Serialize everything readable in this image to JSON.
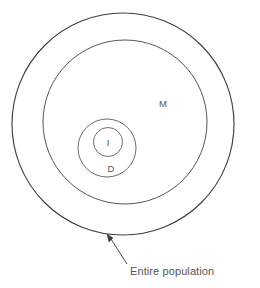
{
  "diagram": {
    "type": "nested-venn",
    "background_color": "#ffffff",
    "stroke_color": "#4a4a4a",
    "text_color": "#555555",
    "circles": [
      {
        "id": "outer",
        "label": "",
        "cx": 123,
        "cy": 124,
        "r": 111,
        "name": "entire-population-circle"
      },
      {
        "id": "m",
        "label": "M",
        "label_x": 163,
        "label_y": 104,
        "cx": 125,
        "cy": 122,
        "r": 82,
        "name": "m-circle"
      },
      {
        "id": "d",
        "label": "D",
        "label_x": 111,
        "label_y": 169,
        "cx": 107,
        "cy": 148,
        "r": 29,
        "name": "d-circle"
      },
      {
        "id": "i",
        "label": "I",
        "label_x": 108,
        "label_y": 143,
        "cx": 108,
        "cy": 142,
        "r": 14.5,
        "name": "i-circle"
      }
    ],
    "callout": {
      "text": "Entire population",
      "text_x": 130,
      "text_y": 275,
      "line_start_x": 127,
      "line_start_y": 264,
      "line_end_x": 110,
      "line_end_y": 238,
      "arrow_tip_x": 107,
      "arrow_tip_y": 234
    },
    "labels": {
      "m": "M",
      "d": "D",
      "i": "I",
      "callout": "Entire population"
    }
  }
}
